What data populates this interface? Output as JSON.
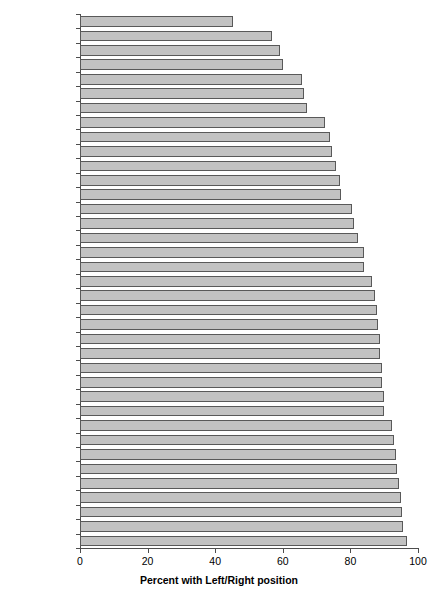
{
  "chart_data": {
    "type": "bar",
    "orientation": "horizontal",
    "title": "",
    "subtitle": "",
    "xlabel": "Percent with Left/Right position",
    "ylabel": "",
    "xlim": [
      0,
      100
    ],
    "xticks": [
      0,
      20,
      40,
      60,
      80,
      100
    ],
    "xtick_labels": [
      "0",
      "20",
      "40",
      "60",
      "80",
      "100"
    ],
    "grid": false,
    "legend": null,
    "bar_color": "#c2c2c2",
    "bar_edge_color": "#595959",
    "axis_color": "#4d4d4d",
    "categories": [
      "Taiwan",
      "Kyrgyzstan",
      "Slovenia",
      "Ukraine",
      "Romania",
      "Lithuania",
      "Russia",
      "UK",
      "Ireland",
      "Mexico",
      "Poland",
      "N Zealand",
      "Brazil",
      "Australia",
      "S Korea",
      "Portugal",
      "Italy",
      "USA",
      "Spain",
      "Canada",
      "Chile",
      "Iceland",
      "Belgium",
      "Finland",
      "Japan",
      "Hungary",
      "Bulgaria",
      "Czech Rep.",
      "Albania",
      "Germany",
      "Israel",
      "Swiss",
      "Norway",
      "Denmark",
      "Sweden",
      "France",
      "Netherlands"
    ],
    "values": [
      45.4,
      56.8,
      59.2,
      60.1,
      65.7,
      66.3,
      67.2,
      72.5,
      74.0,
      74.6,
      75.7,
      77.0,
      77.2,
      80.5,
      81.1,
      82.2,
      84.0,
      84.0,
      86.4,
      87.3,
      87.9,
      88.2,
      88.8,
      88.8,
      89.3,
      89.3,
      89.9,
      89.9,
      92.3,
      92.9,
      93.5,
      93.8,
      94.4,
      95.0,
      95.3,
      95.6,
      96.7
    ]
  }
}
